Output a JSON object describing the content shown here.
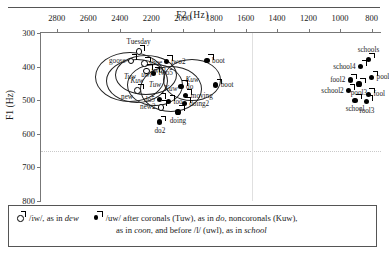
{
  "chart_data": {
    "type": "scatter",
    "title": "",
    "xlabel": "F2 (Hz)",
    "ylabel": "F1 (Hz)",
    "xlim": [
      2900,
      740
    ],
    "ylim": [
      300,
      800
    ],
    "x_reversed": true,
    "y_reversed": true,
    "xticks": [
      2800,
      2600,
      2400,
      2200,
      2000,
      1800,
      1600,
      1400,
      1200,
      1000,
      800
    ],
    "yticks": [
      300,
      400,
      500,
      600,
      700,
      800
    ],
    "grid": "dotted horizontal line at F1=650; light vertical line at F2=1560",
    "gridlines": {
      "horizontal": [
        650
      ],
      "vertical": [
        1560
      ]
    },
    "legend_position": "below-plot-boxed",
    "series": [
      {
        "name": "iw",
        "marker": "open-circle-with-tail",
        "legend": "/iw/, as in dew",
        "points": [
          {
            "label": "goose",
            "x": 2330,
            "y": 383,
            "pos": "l"
          },
          {
            "label": "Tuesday",
            "x": 2280,
            "y": 355,
            "pos": "t"
          },
          {
            "label": "shoe",
            "x": 2245,
            "y": 390,
            "pos": "r"
          },
          {
            "label": "new",
            "x": 2290,
            "y": 470,
            "pos": "bl"
          },
          {
            "label": "new2",
            "x": 2140,
            "y": 520,
            "pos": "l"
          },
          {
            "label": "two3",
            "x": 2230,
            "y": 412,
            "pos": "r"
          }
        ]
      },
      {
        "name": "uw",
        "marker": "filled-circle-with-tail",
        "legend": "/uw/ after coronals (Tuw), as in do, noncoronals (Kuw), as in coon, and before /l/ (uwl), as in school",
        "points": [
          {
            "label": "two2",
            "x": 2105,
            "y": 385,
            "pos": "r"
          },
          {
            "label": "boot",
            "x": 1845,
            "y": 383,
            "pos": "r"
          },
          {
            "label": "boot",
            "x": 1790,
            "y": 455,
            "pos": "r"
          },
          {
            "label": "two5",
            "x": 2185,
            "y": 420,
            "pos": "r"
          },
          {
            "label": "do",
            "x": 2010,
            "y": 460,
            "pos": "r"
          },
          {
            "label": "moving",
            "x": 1980,
            "y": 487,
            "pos": "r"
          },
          {
            "label": "doing2",
            "x": 1990,
            "y": 510,
            "pos": "r"
          },
          {
            "label": "doing",
            "x": 2030,
            "y": 535,
            "pos": "b"
          },
          {
            "label": "too",
            "x": 2090,
            "y": 505,
            "pos": "r"
          },
          {
            "label": "do5",
            "x": 2145,
            "y": 498,
            "pos": "l"
          },
          {
            "label": "do2",
            "x": 2145,
            "y": 565,
            "pos": "b"
          },
          {
            "label": "schools",
            "x": 820,
            "y": 378,
            "pos": "t"
          },
          {
            "label": "school4",
            "x": 870,
            "y": 400,
            "pos": "l"
          },
          {
            "label": "pool",
            "x": 800,
            "y": 432,
            "pos": "r"
          },
          {
            "label": "fool2",
            "x": 935,
            "y": 440,
            "pos": "l"
          },
          {
            "label": "pool3",
            "x": 880,
            "y": 452,
            "pos": "b"
          },
          {
            "label": "school2",
            "x": 945,
            "y": 472,
            "pos": "l"
          },
          {
            "label": "fool",
            "x": 820,
            "y": 482,
            "pos": "r"
          },
          {
            "label": "school",
            "x": 905,
            "y": 500,
            "pos": "b"
          },
          {
            "label": "fool3",
            "x": 830,
            "y": 505,
            "pos": "b"
          }
        ]
      }
    ],
    "annotations": [
      {
        "label": "Tuw",
        "x": 2335,
        "y": 432,
        "rx": 34,
        "ry": 24
      },
      {
        "label": "Kuw",
        "x": 2290,
        "y": 442,
        "rx": 30,
        "ry": 21
      },
      {
        "label": "uwl",
        "x": 2230,
        "y": 424,
        "rx": 30,
        "ry": 19
      },
      {
        "label": "Tuw",
        "x": 2175,
        "y": 455,
        "rx": 27,
        "ry": 20
      },
      {
        "label": "Kuw",
        "x": 2075,
        "y": 468,
        "rx": 30,
        "ry": 22
      },
      {
        "label": "Kuw",
        "x": 1940,
        "y": 440,
        "rx": 28,
        "ry": 20
      }
    ]
  },
  "axes": {
    "x_title": "F2  (Hz)",
    "y_title": "F1  (Hz)"
  },
  "legend": {
    "entry1_key": "open-circle-tail-marker",
    "entry1_pre": "/iw/, as in ",
    "entry1_em": "dew",
    "entry2_key": "filled-circle-tail-marker",
    "entry2_a": "/uw/ after coronals (Tuw), as in ",
    "entry2_em1": "do",
    "entry2_b": ", noncoronals (Kuw),",
    "entry2_c": "as in ",
    "entry2_em2": "coon",
    "entry2_d": ", and before /l/ (uwl), as in ",
    "entry2_em3": "school"
  }
}
